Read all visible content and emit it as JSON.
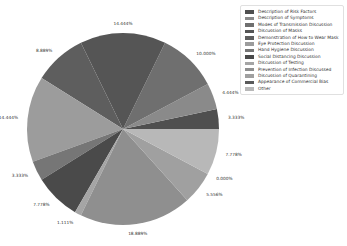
{
  "chart_data": {
    "type": "pie",
    "title": "",
    "start_angle_deg": 0,
    "direction": "counterclockwise",
    "legend_position": "upper right",
    "categories": [
      "Description of Risk Factors",
      "Description of Symptoms",
      "Modes of Transmission Discussion",
      "Discussion of Masks",
      "Demonstration of How to Wear Mask",
      "Eye Protection Discussion",
      "Hand Hygiene Discussion",
      "Social Distancing Discussion",
      "Discussion of Testing",
      "Prevention of Infection Discussed",
      "Discussion of Quarantining",
      "Appearance of Commercial Bias",
      "Other"
    ],
    "values": [
      3.333,
      4.444,
      10.0,
      14.444,
      8.889,
      14.444,
      3.333,
      7.778,
      1.111,
      18.889,
      5.556,
      0.0,
      7.778
    ],
    "labels": [
      "3.333%",
      "4.444%",
      "10.000%",
      "14.444%",
      "8.889%",
      "14.444%",
      "3.333%",
      "7.778%",
      "1.111%",
      "18.889%",
      "5.556%",
      "0.000%",
      "7.778%"
    ],
    "colors": [
      "#4f4f4f",
      "#8a8a8a",
      "#6f6f6f",
      "#555555",
      "#5e5e5e",
      "#9c9c9c",
      "#767676",
      "#4a4a4a",
      "#a5a5a5",
      "#8f8f8f",
      "#a0a0a0",
      "#5a5a5a",
      "#b8b8b8"
    ]
  }
}
